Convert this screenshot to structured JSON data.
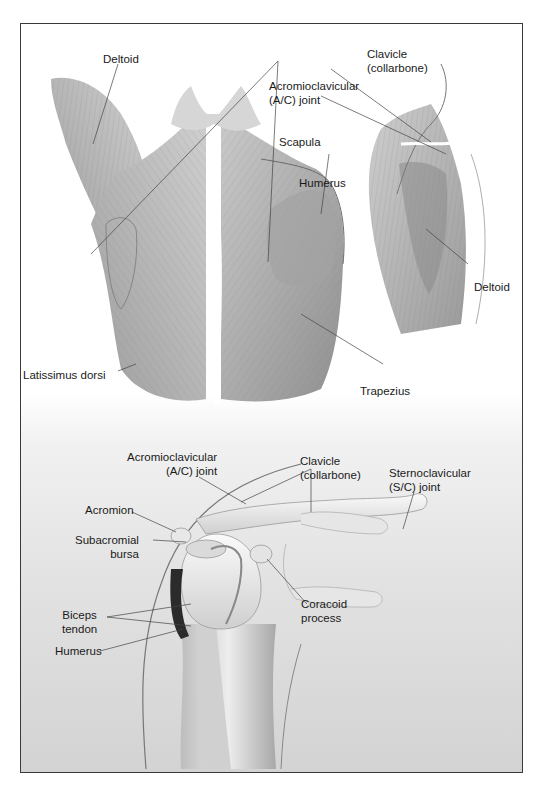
{
  "figure": {
    "top_panel": {
      "title": "Posterior view of back and shoulder muscles, with lateral view of arm",
      "labels": {
        "deltoid_left": "Deltoid",
        "clavicle_line1": "Clavicle",
        "clavicle_line2": "(collarbone)",
        "ac_joint_line1": "Acromioclavicular",
        "ac_joint_line2": "(A/C) joint",
        "scapula": "Scapula",
        "humerus": "Humerus",
        "deltoid_right": "Deltoid",
        "latissimus_dorsi": "Latissimus dorsi",
        "trapezius": "Trapezius"
      }
    },
    "bottom_panel": {
      "title": "Anterior view of shoulder joint",
      "labels": {
        "ac_joint_line1": "Acromioclavicular",
        "ac_joint_line2": "(A/C) joint",
        "clavicle_line1": "Clavicle",
        "clavicle_line2": "(collarbone)",
        "sc_joint_line1": "Sternoclavicular",
        "sc_joint_line2": "(S/C) joint",
        "acromion": "Acromion",
        "subacromial_line1": "Subacromial",
        "subacromial_line2": "bursa",
        "coracoid_line1": "Coracoid",
        "coracoid_line2": "process",
        "biceps_line1": "Biceps",
        "biceps_line2": "tendon",
        "humerus": "Humerus"
      }
    },
    "colors": {
      "frame_border": "#3a3a3a",
      "muscle_tone": "#9a9a9a",
      "bone_tone": "#ececec",
      "bursa_dark": "#2b2b2b",
      "label_text": "#1a1a1a"
    }
  }
}
